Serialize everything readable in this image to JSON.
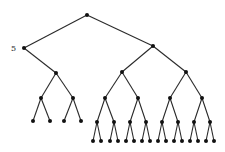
{
  "diagram": {
    "type": "binary-tree",
    "colors": {
      "edge": "#2a2a2a",
      "node": "#111111",
      "label": "#222222",
      "background": "#ffffff"
    },
    "labels": [
      {
        "node": "L",
        "text": "5"
      }
    ],
    "nodes": {
      "R": [
        87,
        15
      ],
      "L": [
        24,
        48
      ],
      "Rr": [
        153,
        46
      ],
      "La": [
        56,
        73
      ],
      "Ra": [
        122,
        72
      ],
      "Rb": [
        186,
        72
      ],
      "La1": [
        41,
        98
      ],
      "La2": [
        73,
        98
      ],
      "Ra1": [
        105,
        98
      ],
      "Ra2": [
        138,
        98
      ],
      "Rb1": [
        170,
        98
      ],
      "Rb2": [
        202,
        98
      ],
      "LL1": [
        33,
        121
      ],
      "LL2": [
        50,
        121
      ],
      "LL3": [
        64,
        121
      ],
      "LL4": [
        81,
        121
      ],
      "M1": [
        97,
        122
      ],
      "M2": [
        114,
        122
      ],
      "M3": [
        130,
        122
      ],
      "M4": [
        146,
        122
      ],
      "M5": [
        162,
        122
      ],
      "M6": [
        178,
        122
      ],
      "M7": [
        194,
        122
      ],
      "M8": [
        210,
        122
      ],
      "B1": [
        93,
        141
      ],
      "B2": [
        101,
        141
      ],
      "B3": [
        110,
        141
      ],
      "B4": [
        118,
        141
      ],
      "B5": [
        126,
        141
      ],
      "B6": [
        134,
        141
      ],
      "B7": [
        142,
        141
      ],
      "B8": [
        150,
        141
      ],
      "B9": [
        158,
        141
      ],
      "B10": [
        166,
        141
      ],
      "B11": [
        174,
        141
      ],
      "B12": [
        182,
        141
      ],
      "B13": [
        190,
        141
      ],
      "B14": [
        198,
        141
      ],
      "B15": [
        206,
        141
      ],
      "B16": [
        214,
        141
      ]
    },
    "edges": [
      [
        "R",
        "L"
      ],
      [
        "R",
        "Rr"
      ],
      [
        "L",
        "La"
      ],
      [
        "Rr",
        "Ra"
      ],
      [
        "Rr",
        "Rb"
      ],
      [
        "La",
        "La1"
      ],
      [
        "La",
        "La2"
      ],
      [
        "Ra",
        "Ra1"
      ],
      [
        "Ra",
        "Ra2"
      ],
      [
        "Rb",
        "Rb1"
      ],
      [
        "Rb",
        "Rb2"
      ],
      [
        "La1",
        "LL1"
      ],
      [
        "La1",
        "LL2"
      ],
      [
        "La2",
        "LL3"
      ],
      [
        "La2",
        "LL4"
      ],
      [
        "Ra1",
        "M1"
      ],
      [
        "Ra1",
        "M2"
      ],
      [
        "Ra2",
        "M3"
      ],
      [
        "Ra2",
        "M4"
      ],
      [
        "Rb1",
        "M5"
      ],
      [
        "Rb1",
        "M6"
      ],
      [
        "Rb2",
        "M7"
      ],
      [
        "Rb2",
        "M8"
      ],
      [
        "M1",
        "B1"
      ],
      [
        "M1",
        "B2"
      ],
      [
        "M2",
        "B3"
      ],
      [
        "M2",
        "B4"
      ],
      [
        "M3",
        "B5"
      ],
      [
        "M3",
        "B6"
      ],
      [
        "M4",
        "B7"
      ],
      [
        "M4",
        "B8"
      ],
      [
        "M5",
        "B9"
      ],
      [
        "M5",
        "B10"
      ],
      [
        "M6",
        "B11"
      ],
      [
        "M6",
        "B12"
      ],
      [
        "M7",
        "B13"
      ],
      [
        "M7",
        "B14"
      ],
      [
        "M8",
        "B15"
      ],
      [
        "M8",
        "B16"
      ]
    ]
  }
}
